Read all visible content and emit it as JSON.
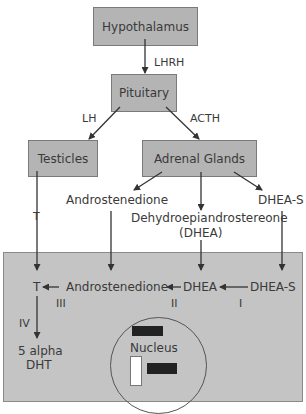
{
  "nodes": {
    "hypothalamus": "Hypothalamus",
    "pituitary": "Pituitary",
    "testicles": "Testicles",
    "adrenal": "Adrenal Glands",
    "androstenedione_top": "Androstenedione",
    "dhea_long_line1": "Dehydroepiandrostereone",
    "dhea_long_line2": "(DHEA)",
    "dhea_s_top": "DHEA-S",
    "t_cell": "T",
    "androstenedione_cell": "Androstenedione",
    "dhea_cell": "DHEA",
    "dhea_s_cell": "DHEA-S",
    "dht_line1": "5 alpha",
    "dht_line2": "DHT",
    "nucleus": "Nucleus"
  },
  "edges": {
    "lhrh": "LHRH",
    "lh": "LH",
    "acth": "ACTH",
    "t": "T",
    "step_i": "I",
    "step_ii": "II",
    "step_iii": "III",
    "step_iv": "IV"
  },
  "colors": {
    "box_fill": "#b4b4b4",
    "cell_fill": "#c4c4c4",
    "stroke": "#333333"
  }
}
